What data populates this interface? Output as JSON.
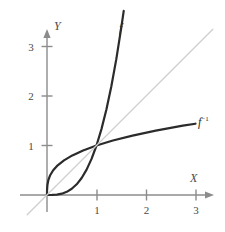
{
  "chart_data": {
    "type": "line",
    "title": "",
    "xlabel": "X",
    "ylabel": "Y",
    "xlim": [
      -0.4,
      3.5
    ],
    "ylim": [
      -0.4,
      3.5
    ],
    "grid": false,
    "legend_position": "inline-curve-labels",
    "xticks": [
      "1",
      "2",
      "3"
    ],
    "xtick_values": [
      1,
      2,
      3
    ],
    "yticks": [
      "1",
      "2",
      "3"
    ],
    "ytick_values": [
      1,
      2,
      3
    ],
    "annotations": [
      {
        "text": "f",
        "x": 2.0,
        "y": 3.45
      },
      {
        "text": "f⁻¹",
        "x": 3.15,
        "y": 1.55
      }
    ],
    "series": [
      {
        "name": "f",
        "label": "f",
        "formula": "y = x^3",
        "color": "#2b2b2b",
        "width": 2.2,
        "x": [
          0.0,
          0.1,
          0.2,
          0.3,
          0.4,
          0.5,
          0.6,
          0.7,
          0.8,
          0.9,
          1.0,
          1.1,
          1.2,
          1.3,
          1.4,
          1.5,
          1.55
        ],
        "y": [
          0.0,
          0.001,
          0.008,
          0.027,
          0.064,
          0.125,
          0.216,
          0.343,
          0.512,
          0.729,
          1.0,
          1.331,
          1.728,
          2.197,
          2.744,
          3.375,
          3.72
        ]
      },
      {
        "name": "f-inverse",
        "label": "f⁻¹",
        "formula": "y = x^(1/3)",
        "color": "#2b2b2b",
        "width": 2.2,
        "x": [
          0.0,
          0.001,
          0.008,
          0.027,
          0.064,
          0.125,
          0.216,
          0.343,
          0.512,
          0.729,
          1.0,
          1.331,
          1.728,
          2.197,
          2.744,
          3.0
        ],
        "y": [
          0.0,
          0.1,
          0.2,
          0.3,
          0.4,
          0.5,
          0.6,
          0.7,
          0.8,
          0.9,
          1.0,
          1.1,
          1.2,
          1.3,
          1.4,
          1.44
        ]
      },
      {
        "name": "identity-line",
        "label": "y = x",
        "formula": "y = x",
        "color": "#cfcfcf",
        "width": 1.3,
        "x": [
          -0.4,
          3.35
        ],
        "y": [
          -0.4,
          3.35
        ]
      }
    ],
    "axes": {
      "color": "#8c8c8c",
      "x_axis_label": "X",
      "y_axis_label": "Y",
      "arrowheads": true
    },
    "key_points": [
      {
        "label": "origin",
        "x": 0,
        "y": 0
      },
      {
        "label": "intersection",
        "x": 1,
        "y": 1
      }
    ]
  },
  "labels": {
    "x_axis": "X",
    "y_axis": "Y",
    "f": "f",
    "f_inverse_base": "f",
    "f_inverse_sup": "−1",
    "x1": "1",
    "x2": "2",
    "x3": "3",
    "y1": "1",
    "y2": "2",
    "y3": "3"
  }
}
